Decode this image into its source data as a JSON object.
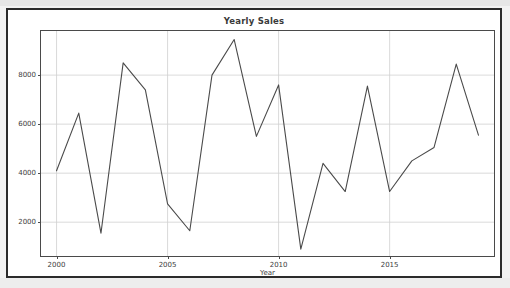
{
  "figure": {
    "title": "Yearly Sales",
    "frame_color": "#2b2b2b",
    "page_background": "#f2f2f2",
    "plot_background": "#ffffff"
  },
  "chart_data": {
    "type": "line",
    "title": "Yearly Sales",
    "xlabel": "Year",
    "ylabel": "",
    "grid": true,
    "legend": false,
    "line_color": "#4a4a4a",
    "xlim": [
      1999.3,
      2019.7
    ],
    "ylim": [
      620,
      9800
    ],
    "xticks": [
      2000,
      2005,
      2010,
      2015
    ],
    "xtick_labels": [
      "2000",
      "2005",
      "2010",
      "2015"
    ],
    "yticks": [
      2000,
      4000,
      6000,
      8000
    ],
    "ytick_labels": [
      "2000",
      "4000",
      "6000",
      "8000"
    ],
    "x": [
      2000,
      2001,
      2002,
      2003,
      2004,
      2005,
      2006,
      2007,
      2008,
      2009,
      2010,
      2011,
      2012,
      2013,
      2014,
      2015,
      2016,
      2017,
      2018,
      2019
    ],
    "series": [
      {
        "name": "Sales",
        "values": [
          4100,
          6450,
          1550,
          8500,
          7400,
          2750,
          1650,
          8000,
          9450,
          5500,
          7600,
          900,
          4400,
          3250,
          7550,
          3250,
          4500,
          5050,
          8450,
          5550
        ]
      }
    ]
  }
}
